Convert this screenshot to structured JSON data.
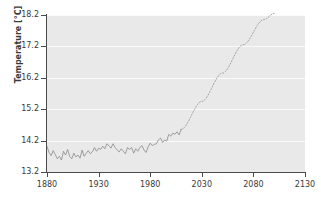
{
  "chart_data": {
    "type": "line",
    "title": "",
    "xlabel": "",
    "ylabel": "Temperature [°C]",
    "xlim": [
      1880,
      2130
    ],
    "ylim": [
      13.2,
      18.2
    ],
    "grid": true,
    "legend": "none",
    "xticks": [
      1880,
      1930,
      1980,
      2030,
      2080,
      2130
    ],
    "yticks": [
      13.2,
      14.2,
      15.2,
      16.2,
      17.2,
      18.2
    ],
    "xtick_labels": [
      "1880",
      "1930",
      "1980",
      "2030",
      "2080",
      "2130"
    ],
    "ytick_labels": [
      "13.2",
      "14.2",
      "15.2",
      "16.2",
      "17.2",
      "18.2"
    ],
    "xtick_minor": [
      1905,
      1955,
      2005,
      2055,
      2105
    ],
    "colors": {
      "plot_background": "#e9e9e9",
      "canvas_background": "#ffffff",
      "gridline": "#fafafa",
      "axis": "#4a4a4a",
      "observed_line": "#8a8a8a",
      "projected_line": "#9a9a9a",
      "text": "#3a3a3a"
    },
    "series": [
      {
        "name": "Observed temperature",
        "style": "solid",
        "color": "#8a8a8a",
        "x": [
          1880,
          1882,
          1884,
          1886,
          1888,
          1890,
          1892,
          1894,
          1896,
          1898,
          1900,
          1902,
          1904,
          1906,
          1908,
          1910,
          1912,
          1914,
          1916,
          1918,
          1920,
          1922,
          1924,
          1926,
          1928,
          1930,
          1932,
          1934,
          1936,
          1938,
          1940,
          1942,
          1944,
          1946,
          1948,
          1950,
          1952,
          1954,
          1956,
          1958,
          1960,
          1962,
          1964,
          1966,
          1968,
          1970,
          1972,
          1974,
          1976,
          1978,
          1980,
          1982,
          1984,
          1986,
          1988,
          1990,
          1992,
          1994,
          1996,
          1998,
          2000,
          2002,
          2004,
          2006,
          2008,
          2010
        ],
        "values": [
          14.02,
          13.82,
          13.72,
          13.88,
          13.76,
          13.62,
          13.7,
          13.58,
          13.86,
          13.74,
          13.92,
          13.7,
          13.62,
          13.8,
          13.68,
          13.74,
          13.64,
          13.9,
          13.7,
          13.8,
          13.88,
          13.78,
          13.84,
          13.98,
          13.86,
          13.96,
          13.92,
          14.02,
          13.94,
          14.1,
          14.04,
          13.96,
          14.1,
          13.98,
          13.9,
          13.84,
          13.94,
          13.86,
          13.78,
          13.98,
          13.92,
          13.98,
          13.8,
          13.94,
          13.86,
          13.98,
          14.04,
          13.9,
          13.82,
          14.0,
          14.12,
          14.04,
          14.08,
          14.1,
          14.22,
          14.28,
          14.14,
          14.22,
          14.18,
          14.4,
          14.34,
          14.44,
          14.4,
          14.48,
          14.38,
          14.56
        ]
      },
      {
        "name": "Projected temperature",
        "style": "dotted",
        "color": "#9a9a9a",
        "x": [
          2010,
          2030,
          2050,
          2070,
          2090,
          2100
        ],
        "values": [
          14.56,
          15.45,
          16.35,
          17.25,
          18.05,
          18.25
        ]
      }
    ],
    "annotations": []
  }
}
